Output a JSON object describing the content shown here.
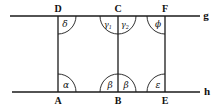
{
  "diagram": {
    "lines": [
      {
        "name": "g",
        "label": "g"
      },
      {
        "name": "h",
        "label": "h"
      }
    ],
    "points": {
      "D": "D",
      "C": "C",
      "F": "F",
      "A": "A",
      "B": "B",
      "E": "E"
    },
    "angles": {
      "delta": "δ",
      "gamma1": "γ",
      "gamma1_sub": "1",
      "gamma2": "γ",
      "gamma2_sub": "2",
      "phi": "ϕ",
      "alpha": "α",
      "beta_left": "β",
      "beta_right": "β",
      "epsilon": "ε"
    },
    "segments": [
      "DA",
      "CB",
      "FE"
    ]
  }
}
